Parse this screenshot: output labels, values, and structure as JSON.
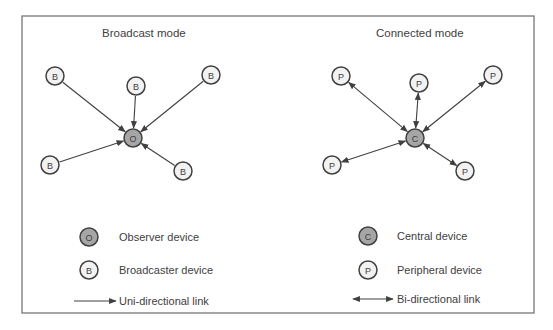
{
  "colors": {
    "frame": "#6b6b6b",
    "link": "#404040",
    "node_stroke": "#404040",
    "node_light_fill": "#f2f2f2",
    "node_dark_fill": "#a6a6a6",
    "text": "#404040"
  },
  "frame": {
    "x": 22,
    "y": 16,
    "w": 512,
    "h": 297
  },
  "panels": [
    {
      "id": "broadcast",
      "title": "Broadcast mode",
      "title_pos": [
        102,
        37
      ],
      "hub": {
        "label": "O",
        "x": 133,
        "y": 138,
        "role": "observer"
      },
      "link_type": "uni",
      "nodes": [
        {
          "label": "B",
          "x": 55,
          "y": 76,
          "role": "broadcaster"
        },
        {
          "label": "B",
          "x": 136,
          "y": 86,
          "role": "broadcaster"
        },
        {
          "label": "B",
          "x": 211,
          "y": 75,
          "role": "broadcaster"
        },
        {
          "label": "B",
          "x": 50,
          "y": 165,
          "role": "broadcaster"
        },
        {
          "label": "B",
          "x": 183,
          "y": 171,
          "role": "broadcaster"
        }
      ]
    },
    {
      "id": "connected",
      "title": "Connected mode",
      "title_pos": [
        376,
        37
      ],
      "hub": {
        "label": "C",
        "x": 415,
        "y": 138,
        "role": "central"
      },
      "link_type": "bi",
      "nodes": [
        {
          "label": "P",
          "x": 341,
          "y": 76,
          "role": "peripheral"
        },
        {
          "label": "P",
          "x": 419,
          "y": 83,
          "role": "peripheral"
        },
        {
          "label": "P",
          "x": 493,
          "y": 75,
          "role": "peripheral"
        },
        {
          "label": "P",
          "x": 332,
          "y": 165,
          "role": "peripheral"
        },
        {
          "label": "P",
          "x": 465,
          "y": 171,
          "role": "peripheral"
        }
      ]
    }
  ],
  "legend": [
    {
      "kind": "node",
      "fill": "dark",
      "label": "O",
      "x": 89,
      "y": 237,
      "text": "Observer device",
      "text_x": 119
    },
    {
      "kind": "node",
      "fill": "light",
      "label": "B",
      "x": 89,
      "y": 270,
      "text": "Broadcaster device",
      "text_x": 119
    },
    {
      "kind": "uni",
      "x1": 74,
      "x2": 116,
      "y": 301,
      "text": "Uni-directional link",
      "text_x": 119
    },
    {
      "kind": "node",
      "fill": "dark",
      "label": "C",
      "x": 368,
      "y": 236,
      "text": "Central device",
      "text_x": 397
    },
    {
      "kind": "node",
      "fill": "light",
      "label": "P",
      "x": 368,
      "y": 270,
      "text": "Peripheral device",
      "text_x": 397
    },
    {
      "kind": "bi",
      "x1": 353,
      "x2": 393,
      "y": 299,
      "text": "Bi-directional link",
      "text_x": 397
    }
  ],
  "node_radius": 9
}
